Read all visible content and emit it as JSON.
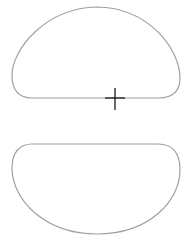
{
  "canvas": {
    "width": 190,
    "height": 249,
    "background": "#ffffff"
  },
  "colors": {
    "shape_stroke": "#a0a0a0",
    "cursor": "#1a1a1a"
  },
  "shapes": [
    {
      "name": "upper-dome-shape",
      "orientation": "flat-bottom"
    },
    {
      "name": "lower-bowl-shape",
      "orientation": "flat-top"
    }
  ],
  "cursor": {
    "type": "crosshair",
    "x": 115,
    "y": 98
  }
}
